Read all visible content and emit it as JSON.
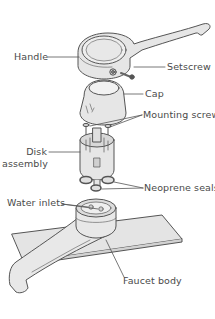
{
  "diagram": {
    "colors": {
      "outline": "#555555",
      "fill": "#e6e6e6",
      "fill_dark": "#cfcfcf",
      "label": "#4a4a4a",
      "background": "#ffffff"
    },
    "labels": {
      "handle": "Handle",
      "setscrew": "Setscrew",
      "cap": "Cap",
      "mounting_screws": "Mounting screws",
      "disk": "Disk",
      "assembly": "assembly",
      "neoprene_seals": "Neoprene seals",
      "water_inlets": "Water inlets",
      "faucet_body": "Faucet body"
    }
  }
}
